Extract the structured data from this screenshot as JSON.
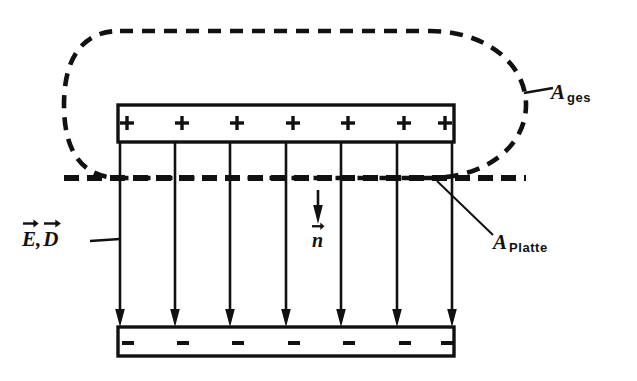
{
  "figure": {
    "domain": "diagram",
    "background_color": "#ffffff",
    "ink_color": "#111111",
    "width": 637,
    "height": 381
  },
  "labels": {
    "a_ges": {
      "symbol": "A",
      "subscript": "ges",
      "full": "A ges"
    },
    "a_platte": {
      "symbol": "A",
      "subscript": "Platte",
      "full": "A Platte"
    },
    "field_vectors": {
      "first": "E",
      "separator": ",",
      "second": "D",
      "full": "E, D"
    },
    "normal_vector": {
      "symbol": "n",
      "full": "n"
    }
  },
  "plates": {
    "top": {
      "charge_sign": "+",
      "charge_count": 7,
      "charges": [
        "+",
        "+",
        "+",
        "+",
        "+",
        "+",
        "+"
      ]
    },
    "bottom": {
      "charge_sign": "−",
      "charge_count": 7,
      "charges": [
        "−",
        "−",
        "−",
        "−",
        "−",
        "−",
        "−"
      ]
    }
  },
  "field_lines": {
    "count": 7,
    "direction": "downward",
    "x_positions": [
      120,
      175,
      230,
      286,
      341,
      397,
      452
    ],
    "y_start": 142,
    "y_end": 327
  },
  "geometry": {
    "box_left": 118,
    "box_right": 454,
    "top_plate_outer_y": 105,
    "top_plate_inner_y": 142,
    "bottom_plate_inner_y": 327,
    "bottom_plate_outer_y": 356,
    "dashed_cut_y": 178,
    "closed_curve": {
      "left": 64,
      "right": 526,
      "top": 31,
      "bottom": 178,
      "style": "dashed stadium"
    }
  },
  "leaders": {
    "a_ges_leader": {
      "x1": 524,
      "y1": 93,
      "x2": 552,
      "y2": 89
    },
    "a_platte_leader": {
      "x1": 437,
      "y1": 181,
      "x2": 492,
      "y2": 234
    },
    "ed_leader": {
      "x1": 92,
      "y1": 240,
      "x2": 120,
      "y2": 240
    }
  }
}
